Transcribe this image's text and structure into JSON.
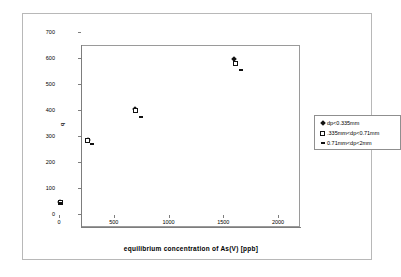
{
  "chart_data": {
    "type": "scatter",
    "title": "",
    "xlabel": "equilibrium concentration of As(V) [ppb]",
    "ylabel": "q",
    "xlim": [
      0,
      2000
    ],
    "ylim": [
      0,
      700
    ],
    "xticks": [
      0,
      500,
      1000,
      1500,
      2000
    ],
    "yticks": [
      0,
      100,
      200,
      300,
      400,
      500,
      600,
      700
    ],
    "grid": false,
    "legend_position": "right",
    "series": [
      {
        "name": "dp<0.335mm",
        "marker": "filled-diamond",
        "color": "#111111",
        "points": [
          {
            "x": 10,
            "y": 45
          },
          {
            "x": 265,
            "y": 283
          },
          {
            "x": 695,
            "y": 402
          },
          {
            "x": 1600,
            "y": 597
          }
        ]
      },
      {
        "name": ".335mm<dp<0.71mm",
        "marker": "open-square",
        "color": "#111111",
        "points": [
          {
            "x": 10,
            "y": 44
          },
          {
            "x": 262,
            "y": 281
          },
          {
            "x": 697,
            "y": 400
          },
          {
            "x": 1610,
            "y": 578
          }
        ]
      },
      {
        "name": "0.71mm<dp<2mm",
        "marker": "dash",
        "color": "#111111",
        "points": [
          {
            "x": 20,
            "y": 42
          },
          {
            "x": 300,
            "y": 268
          },
          {
            "x": 745,
            "y": 375
          },
          {
            "x": 1660,
            "y": 555
          }
        ]
      }
    ]
  },
  "axes": {
    "x_title": "equilibrium concentration of As(V) [ppb]",
    "y_title": "q",
    "x_tick_labels": [
      "0",
      "500",
      "1000",
      "1500",
      "2000"
    ],
    "y_tick_labels": [
      "0",
      "100",
      "200",
      "300",
      "400",
      "500",
      "600",
      "700"
    ]
  },
  "legend": {
    "entries": [
      {
        "label": "dp<0.335mm",
        "marker": "filled-diamond"
      },
      {
        "label": ".335mm<dp<0.71mm",
        "marker": "open-square"
      },
      {
        "label": "0.71mm<dp<2mm",
        "marker": "dash"
      }
    ]
  }
}
